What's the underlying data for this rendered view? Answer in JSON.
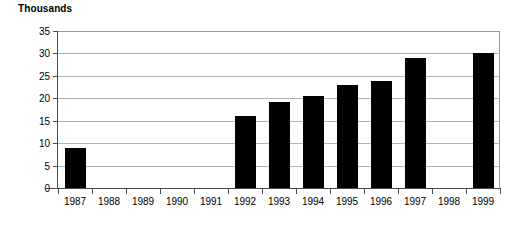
{
  "chart_data": {
    "type": "bar",
    "title": "Thousands",
    "subtitle": "",
    "xlabel": "",
    "ylabel": "",
    "ylim": [
      0,
      35
    ],
    "y_ticks": [
      0,
      5,
      10,
      15,
      20,
      25,
      30,
      35
    ],
    "grid": true,
    "legend": false,
    "legend_position": "none",
    "bar_color": "#000000",
    "gridline_color": "#b3b3b3",
    "axis_color": "#4d4d4d",
    "categories": [
      "1987",
      "1988",
      "1989",
      "1990",
      "1991",
      "1992",
      "1993",
      "1994",
      "1995",
      "1996",
      "1997",
      "1998",
      "1999"
    ],
    "values": [
      8.9,
      null,
      null,
      null,
      null,
      16.1,
      19.1,
      20.5,
      23.0,
      23.8,
      28.9,
      null,
      30.0
    ],
    "annotations": []
  }
}
